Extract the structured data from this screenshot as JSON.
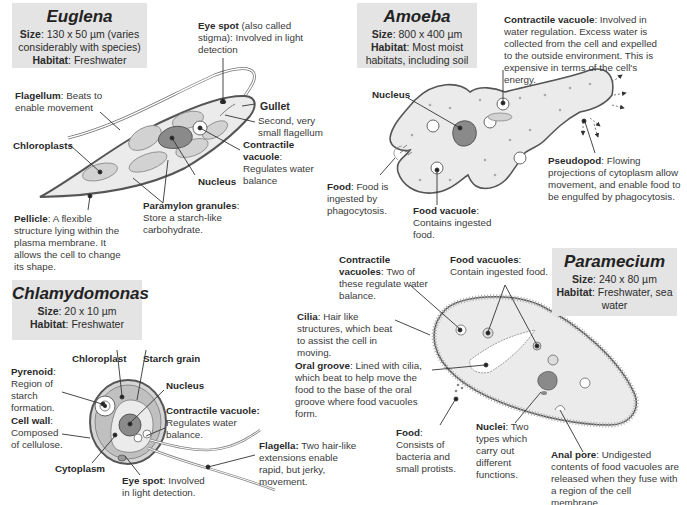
{
  "colors": {
    "box_bg": "#e4e4e4",
    "cell_fill": "#ebebeb",
    "organelle_fill": "#c8c8c8",
    "nucleus_fill": "#8a8a8a",
    "outline": "#555555"
  },
  "euglena": {
    "title": "Euglena",
    "size_label": "Size",
    "size_value": ": 130 x 50 µm (varies considerably with species)",
    "habitat_label": "Habitat",
    "habitat_value": ": Freshwater",
    "labels": {
      "eye_spot": {
        "term": "Eye spot",
        "desc": " (also called stigma): Involved in light detection"
      },
      "gullet": {
        "term": "Gullet",
        "desc": ""
      },
      "second_flagellum": {
        "term": "",
        "desc": "Second, very small flagellum"
      },
      "flagellum": {
        "term": "Flagellum",
        "desc": ": Beats to enable  movement"
      },
      "chloroplasts": {
        "term": "Chloroplasts",
        "desc": ""
      },
      "contractile_vacuole": {
        "term": "Contractile vacuole",
        "desc": ": Regulates water balance"
      },
      "nucleus": {
        "term": "Nucleus",
        "desc": ""
      },
      "paramylon": {
        "term": "Paramylon granules",
        "desc": ": Store a starch-like carbohydrate."
      },
      "pellicle": {
        "term": "Pellicle",
        "desc": ": A flexible structure lying within the plasma membrane. It allows the cell to change its shape."
      }
    }
  },
  "amoeba": {
    "title": "Amoeba",
    "size_label": "Size",
    "size_value": ": 800 x 400 µm",
    "habitat_label": "Habitat",
    "habitat_value": ": Most moist habitats, including soil",
    "labels": {
      "contractile_vacuole": {
        "term": "Contractile vacuole",
        "desc": ": Involved in water regulation. Excess water is collected from the cell and expelled to the outside environment. This is expensive in terms of the cell's energy."
      },
      "nucleus": {
        "term": "Nucleus",
        "desc": ""
      },
      "food": {
        "term": "Food",
        "desc": ": Food is ingested by phagocytosis."
      },
      "food_vacuole": {
        "term": "Food vacuole",
        "desc": ": Contains ingested food."
      },
      "pseudopod": {
        "term": "Pseudopod",
        "desc": ": Flowing projections of cytoplasm allow movement, and enable food to be engulfed by phagocytosis."
      }
    }
  },
  "chlamydomonas": {
    "title": "Chlamydomonas",
    "size_label": "Size",
    "size_value": ": 20 x 10 µm",
    "habitat_label": "Habitat",
    "habitat_value": ": Freshwater",
    "labels": {
      "chloroplast": {
        "term": "Chloroplast",
        "desc": ""
      },
      "starch_grain": {
        "term": "Starch grain",
        "desc": ""
      },
      "pyrenoid": {
        "term": "Pyrenoid",
        "desc": ": Region of starch formation."
      },
      "nucleus": {
        "term": "Nucleus",
        "desc": ""
      },
      "contractile_vacuole": {
        "term": "Contractile vacuole:",
        "desc": " Regulates water balance."
      },
      "cell_wall": {
        "term": "Cell wall",
        "desc": ": Composed of cellulose."
      },
      "cytoplasm": {
        "term": "Cytoplasm",
        "desc": ""
      },
      "eye_spot": {
        "term": "Eye spot",
        "desc": ": Involved in light detection."
      },
      "flagella": {
        "term": "Flagella:",
        "desc": " Two hair-like extensions enable rapid, but jerky, movement."
      }
    }
  },
  "paramecium": {
    "title": "Paramecium",
    "size_label": "Size",
    "size_value": ": 240 x 80 µm",
    "habitat_label": "Habitat",
    "habitat_value": ": Freshwater, sea water",
    "labels": {
      "contractile_vacuoles": {
        "term": "Contractile vacuoles",
        "desc": ": Two of these regulate water balance."
      },
      "food_vacuoles": {
        "term": "Food vacuoles",
        "desc": ": Contain ingested food."
      },
      "cilia": {
        "term": "Cilia",
        "desc": ": Hair like structures, which beat to assist the cell in moving."
      },
      "oral_groove": {
        "term": "Oral groove",
        "desc": ": Lined with cilia, which beat to help move the food to the base of the oral groove where food vacuoles form."
      },
      "food": {
        "term": "Food",
        "desc": ": Consists of bacteria and small protists."
      },
      "nuclei": {
        "term": "Nuclei",
        "desc": ": Two types which carry out different functions."
      },
      "anal_pore": {
        "term": "Anal pore",
        "desc": ": Undigested contents of food vacuoles are released when they fuse with a region of the cell membrane."
      }
    }
  }
}
